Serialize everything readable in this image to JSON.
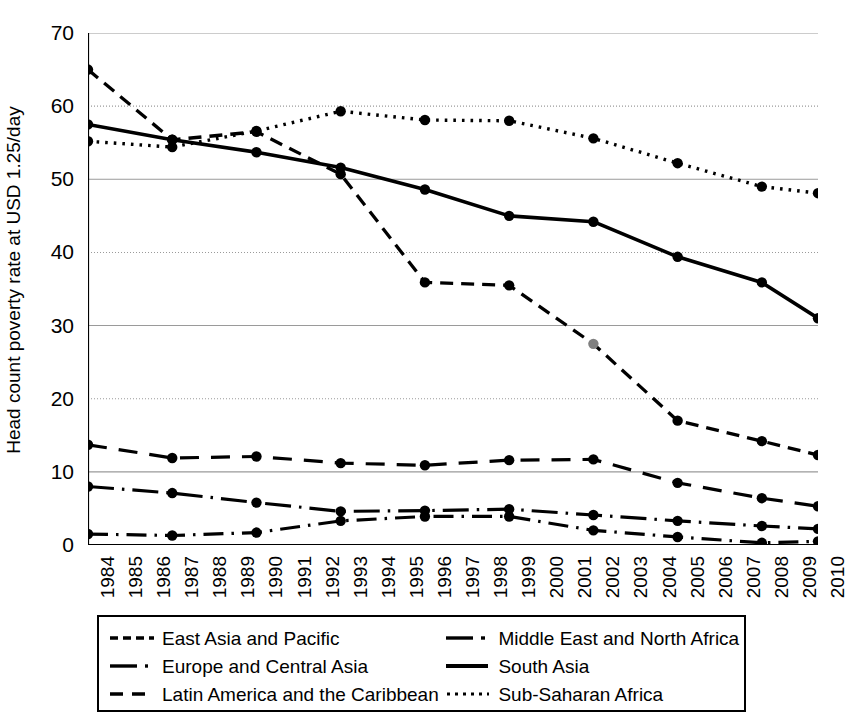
{
  "chart_data": {
    "type": "line",
    "title": "",
    "xlabel": "",
    "ylabel": "Head count poverty rate at USD 1.25/day",
    "ylim": [
      0,
      70
    ],
    "yticks": [
      0,
      10,
      20,
      30,
      40,
      50,
      60,
      70
    ],
    "grid": "horizontal",
    "legend_position": "bottom",
    "marker": "filled-circle",
    "categories": [
      "1984",
      "1985",
      "1986",
      "1987",
      "1988",
      "1989",
      "1990",
      "1991",
      "1992",
      "1993",
      "1994",
      "1995",
      "1996",
      "1997",
      "1998",
      "1999",
      "2000",
      "2001",
      "2002",
      "2003",
      "2004",
      "2005",
      "2006",
      "2007",
      "2008",
      "2009",
      "2010"
    ],
    "data_years": [
      1984,
      1987,
      1990,
      1993,
      1996,
      1999,
      2002,
      2005,
      2008,
      2010
    ],
    "series": [
      {
        "name": "East Asia and Pacific",
        "style": "dashed",
        "x": [
          1984,
          1987,
          1990,
          1993,
          1996,
          1999,
          2002,
          2005,
          2008,
          2010
        ],
        "values": [
          65.0,
          55.4,
          56.5,
          50.7,
          35.9,
          35.5,
          27.5,
          17.0,
          14.2,
          12.3
        ]
      },
      {
        "name": "Europe and Central Asia",
        "style": "dash-dot",
        "x": [
          1984,
          1987,
          1990,
          1993,
          1996,
          1999,
          2002,
          2005,
          2008,
          2010
        ],
        "values": [
          1.5,
          1.3,
          1.7,
          3.3,
          3.9,
          3.9,
          2.0,
          1.1,
          0.3,
          0.5
        ]
      },
      {
        "name": "Latin America and the Caribbean",
        "style": "long-dashed",
        "x": [
          1984,
          1987,
          1990,
          1993,
          1996,
          1999,
          2002,
          2005,
          2008,
          2010
        ],
        "values": [
          13.7,
          11.9,
          12.1,
          11.2,
          10.9,
          11.6,
          11.7,
          8.5,
          6.4,
          5.3
        ]
      },
      {
        "name": "Middle East and North Africa",
        "style": "solid-dot",
        "x": [
          1984,
          1987,
          1990,
          1993,
          1996,
          1999,
          2002,
          2005,
          2008,
          2010
        ],
        "values": [
          8.0,
          7.1,
          5.8,
          4.6,
          4.7,
          4.9,
          4.1,
          3.3,
          2.6,
          2.2
        ]
      },
      {
        "name": "South Asia",
        "style": "solid",
        "x": [
          1984,
          1987,
          1990,
          1993,
          1996,
          1999,
          2002,
          2005,
          2008,
          2010
        ],
        "values": [
          57.5,
          55.4,
          53.7,
          51.6,
          48.6,
          45.0,
          44.2,
          39.4,
          35.9,
          31.0
        ]
      },
      {
        "name": "Sub-Saharan Africa",
        "style": "dotted",
        "x": [
          1984,
          1987,
          1990,
          1993,
          1996,
          1999,
          2002,
          2005,
          2008,
          2010
        ],
        "values": [
          55.2,
          54.4,
          56.6,
          59.3,
          58.1,
          58.0,
          55.6,
          52.2,
          49.0,
          48.1
        ]
      }
    ]
  },
  "axis": {
    "y_title": "Head count poverty rate at USD 1.25/day",
    "y_ticks": [
      "70",
      "60",
      "50",
      "40",
      "30",
      "20",
      "10",
      "0"
    ],
    "x_ticks": [
      "1984",
      "1985",
      "1986",
      "1987",
      "1988",
      "1989",
      "1990",
      "1991",
      "1992",
      "1993",
      "1994",
      "1995",
      "1996",
      "1997",
      "1998",
      "1999",
      "2000",
      "2001",
      "2002",
      "2003",
      "2004",
      "2005",
      "2006",
      "2007",
      "2008",
      "2009",
      "2010"
    ]
  },
  "legend": {
    "rows": [
      {
        "left": {
          "label": "East Asia and Pacific",
          "key": "dashed-line-key"
        },
        "right": {
          "label": "Middle East and North Africa",
          "key": "solid-dot-line-key"
        }
      },
      {
        "left": {
          "label": "Europe and Central Asia",
          "key": "dash-dot-line-key"
        },
        "right": {
          "label": "South Asia",
          "key": "solid-line-key"
        }
      },
      {
        "left": {
          "label": "Latin America and the Caribbean",
          "key": "long-dashed-line-key"
        },
        "right": {
          "label": "Sub-Saharan Africa",
          "key": "dotted-line-key"
        }
      }
    ]
  },
  "colors": {
    "ink": "#000000",
    "grid": "#9a9a9a",
    "background": "#ffffff",
    "highlight_marker": "#808080"
  }
}
